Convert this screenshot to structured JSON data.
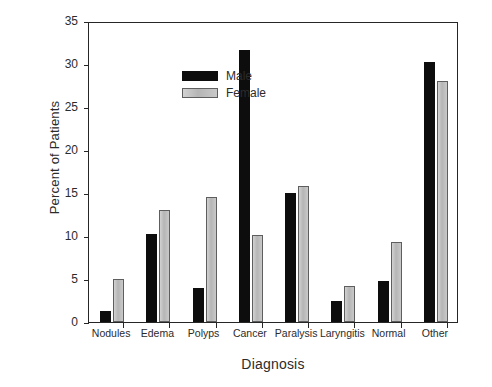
{
  "chart_data": {
    "type": "bar",
    "title": "",
    "xlabel": "Diagnosis",
    "ylabel": "Percent of Patients",
    "categories": [
      "Nodules",
      "Edema",
      "Polyps",
      "Cancer",
      "Paralysis",
      "Laryngitis",
      "Normal",
      "Other"
    ],
    "series": [
      {
        "name": "Male",
        "color": "#0d0d0d",
        "values": [
          1.3,
          10.2,
          4.0,
          31.6,
          15.0,
          2.5,
          4.8,
          30.2
        ]
      },
      {
        "name": "Female",
        "color": "#bdbdbd",
        "values": [
          5.0,
          13.0,
          14.5,
          10.1,
          15.8,
          4.2,
          9.3,
          28.0
        ]
      }
    ],
    "ylim": [
      0,
      35
    ],
    "yticks": [
      0,
      5,
      10,
      15,
      20,
      25,
      30,
      35
    ],
    "ytick_labels": [
      "0",
      "5",
      "10",
      "15",
      "20",
      "25",
      "30",
      "35"
    ],
    "grid": false,
    "legend_position": "upper-left",
    "frame": true
  },
  "legend": {
    "entries": [
      {
        "label": "Male"
      },
      {
        "label": "Female"
      }
    ]
  },
  "axes": {
    "y_title": "Percent of Patients",
    "x_title": "Diagnosis"
  }
}
